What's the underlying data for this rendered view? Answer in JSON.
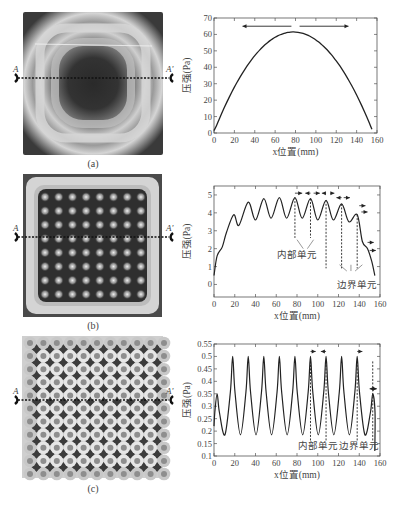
{
  "panels": [
    {
      "id": "a",
      "caption": "(a)",
      "section_labels": {
        "left": "A",
        "right": "A'"
      }
    },
    {
      "id": "b",
      "caption": "(b)",
      "section_labels": {
        "left": "A",
        "right": "A'"
      }
    },
    {
      "id": "c",
      "caption": "(c)",
      "section_labels": {
        "left": "A",
        "right": "A'"
      }
    }
  ],
  "colors": {
    "line": "#222222",
    "axis": "#555555",
    "text": "#444444"
  },
  "chart_data": [
    {
      "type": "line",
      "panel": "a",
      "title": "",
      "xlabel": "x位置(mm)",
      "ylabel": "压强(Pa)",
      "xlim": [
        0,
        160
      ],
      "ylim": [
        0,
        70
      ],
      "xticks": [
        0,
        20,
        40,
        60,
        80,
        100,
        120,
        140,
        160
      ],
      "yticks": [
        0,
        10,
        20,
        30,
        40,
        50,
        60,
        70
      ],
      "x": [
        0,
        10,
        20,
        30,
        40,
        50,
        60,
        70,
        78,
        90,
        100,
        110,
        120,
        130,
        140,
        150,
        155
      ],
      "values": [
        2,
        18,
        30,
        40,
        47,
        53,
        57,
        59.5,
        60,
        59,
        56,
        51,
        44,
        34,
        22,
        9,
        2
      ],
      "annotations": [
        {
          "type": "double-arrow",
          "x_from": 28,
          "x_to": 132,
          "y": 65
        }
      ],
      "grid": false
    },
    {
      "type": "line",
      "panel": "b",
      "title": "",
      "xlabel": "x位置(mm)",
      "ylabel": "压强(Pa)",
      "xlim": [
        0,
        160
      ],
      "ylim": [
        -0.7,
        5.5
      ],
      "xticks": [
        0,
        20,
        40,
        60,
        80,
        100,
        120,
        140,
        160
      ],
      "yticks": [
        0,
        1,
        2,
        3,
        4,
        5
      ],
      "x": [
        0,
        3,
        8,
        12,
        19,
        24,
        33,
        40,
        48,
        55,
        63,
        70,
        78,
        85,
        93,
        100,
        108,
        115,
        123,
        130,
        138,
        143,
        148,
        152,
        155
      ],
      "values": [
        0.5,
        1.6,
        2.1,
        2.9,
        3.9,
        3.3,
        4.6,
        3.6,
        4.8,
        3.7,
        4.85,
        3.7,
        4.85,
        3.7,
        4.8,
        3.6,
        4.7,
        3.6,
        4.5,
        3.5,
        3.9,
        2.4,
        2.0,
        1.3,
        0.5
      ],
      "annotations": [
        {
          "text": "内部单元",
          "x": 80,
          "y": 1.5
        },
        {
          "text": "边界单元",
          "x": 138,
          "y": -0.2
        }
      ],
      "grid": false
    },
    {
      "type": "line",
      "panel": "c",
      "title": "",
      "xlabel": "x位置(mm)",
      "ylabel": "压强(Pa)",
      "xlim": [
        0,
        160
      ],
      "ylim": [
        0.1,
        0.55
      ],
      "xticks": [
        0,
        20,
        40,
        60,
        80,
        100,
        120,
        140,
        160
      ],
      "yticks": [
        0.1,
        0.15,
        0.2,
        0.25,
        0.3,
        0.35,
        0.4,
        0.45,
        0.5,
        0.55
      ],
      "peaks_x": [
        3,
        18,
        33,
        48,
        63,
        78,
        93,
        108,
        123,
        138,
        153
      ],
      "peaks_y": [
        0.35,
        0.5,
        0.5,
        0.5,
        0.5,
        0.5,
        0.5,
        0.5,
        0.5,
        0.5,
        0.35
      ],
      "valley_y": 0.185,
      "annotations": [
        {
          "text": "内部单元",
          "x": 100,
          "y": 0.13
        },
        {
          "text": "边界单元",
          "x": 140,
          "y": 0.13
        }
      ],
      "grid": false
    }
  ]
}
